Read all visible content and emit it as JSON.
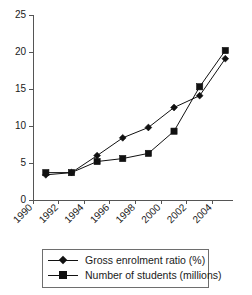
{
  "chart_data": {
    "type": "line",
    "title": "",
    "subtitle": "",
    "xlabel": "",
    "ylabel": "",
    "x": [
      1991,
      1993,
      1995,
      1997,
      1999,
      2001,
      2003,
      2005
    ],
    "xlim": [
      1990,
      2005.6
    ],
    "ylim": [
      0,
      25
    ],
    "ytick_labels": [
      "0",
      "5",
      "10",
      "15",
      "20",
      "25"
    ],
    "ytick_values": [
      0,
      5,
      10,
      15,
      20,
      25
    ],
    "xtick_labels": [
      "1990",
      "1992",
      "1994",
      "1996",
      "1998",
      "2000",
      "2002",
      "2004"
    ],
    "xtick_values": [
      1990,
      1992,
      1994,
      1996,
      1998,
      2000,
      2002,
      2004
    ],
    "xtick_rotation_deg": 45,
    "grid": false,
    "legend_position": "below-plot",
    "series": [
      {
        "name": "Gross enrolment ratio (%)",
        "marker": "diamond",
        "color": "#111111",
        "values": [
          3.4,
          3.7,
          6.0,
          8.4,
          9.8,
          12.5,
          14.1,
          19.1
        ]
      },
      {
        "name": "Number of students (millions)",
        "marker": "square",
        "color": "#111111",
        "values": [
          3.7,
          3.7,
          5.2,
          5.6,
          6.3,
          9.3,
          15.3,
          20.2
        ]
      }
    ]
  },
  "legend": {
    "items": [
      {
        "label": "Gross enrolment ratio (%)",
        "marker": "diamond"
      },
      {
        "label": "Number of students (millions)",
        "marker": "square"
      }
    ]
  }
}
